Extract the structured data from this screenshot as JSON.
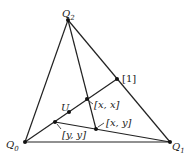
{
  "diagram": {
    "points": {
      "Q0": {
        "label": "Q",
        "sub": "0",
        "x": 25,
        "y": 142
      },
      "Q1": {
        "label": "Q",
        "sub": "1",
        "x": 170,
        "y": 142
      },
      "Q2": {
        "label": "Q",
        "sub": "2",
        "x": 68,
        "y": 20
      },
      "one": {
        "label": "[1]",
        "x": 117,
        "y": 79
      },
      "xx": {
        "label": "[x, x]",
        "x": 87,
        "y": 99
      },
      "U": {
        "label": "U",
        "x": 69,
        "y": 112
      },
      "yy": {
        "label": "[y, y]",
        "x": 55,
        "y": 122
      },
      "xy": {
        "label": "[x, y]",
        "x": 96,
        "y": 129
      }
    },
    "lines": [
      [
        "Q0",
        "Q1"
      ],
      [
        "Q0",
        "Q2"
      ],
      [
        "Q2",
        "Q1"
      ],
      [
        "Q0",
        "one"
      ],
      [
        "Q2",
        "xy"
      ],
      [
        "yy",
        "Q1"
      ]
    ],
    "colors": {
      "stroke": "#222222",
      "background": "#ffffff"
    }
  }
}
